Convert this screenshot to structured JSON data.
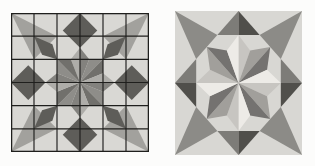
{
  "page": {
    "background": "#fcfcfb"
  },
  "figures": [
    {
      "name": "quilt-block-grid-design",
      "x": 11,
      "y": 13,
      "width": 138,
      "height": 139,
      "units": 12,
      "background": "#d9d8d4",
      "grid": {
        "divisions": 6,
        "color": "#1f1f1d",
        "line_width": 0.1,
        "border_width": 0.22
      },
      "polygons": [
        {
          "points": [
            [
              0,
              0
            ],
            [
              4,
              2
            ],
            [
              2,
              4
            ]
          ],
          "fill": "#a2a19d"
        },
        {
          "points": [
            [
              12,
              0
            ],
            [
              8,
              2
            ],
            [
              10,
              4
            ]
          ],
          "fill": "#a2a19d"
        },
        {
          "points": [
            [
              0,
              12
            ],
            [
              2,
              8
            ],
            [
              4,
              10
            ]
          ],
          "fill": "#a2a19d"
        },
        {
          "points": [
            [
              12,
              12
            ],
            [
              10,
              8
            ],
            [
              8,
              10
            ]
          ],
          "fill": "#a2a19d"
        },
        {
          "points": [
            [
              6,
              0
            ],
            [
              7.5,
              1.5
            ],
            [
              6,
              3
            ],
            [
              4.5,
              1.5
            ]
          ],
          "fill": "#5e5d59"
        },
        {
          "points": [
            [
              12,
              6
            ],
            [
              10.5,
              7.5
            ],
            [
              9,
              6
            ],
            [
              10.5,
              4.5
            ]
          ],
          "fill": "#5e5d59"
        },
        {
          "points": [
            [
              6,
              12
            ],
            [
              4.5,
              10.5
            ],
            [
              6,
              9
            ],
            [
              7.5,
              10.5
            ]
          ],
          "fill": "#5e5d59"
        },
        {
          "points": [
            [
              0,
              6
            ],
            [
              1.5,
              4.5
            ],
            [
              3,
              6
            ],
            [
              1.5,
              7.5
            ]
          ],
          "fill": "#5e5d59"
        },
        {
          "points": [
            [
              2,
              2
            ],
            [
              3.6,
              2.7
            ],
            [
              4,
              4
            ],
            [
              2.7,
              3.6
            ]
          ],
          "fill": "#5e5d59"
        },
        {
          "points": [
            [
              10,
              2
            ],
            [
              9.3,
              3.6
            ],
            [
              8,
              4
            ],
            [
              8.4,
              2.7
            ]
          ],
          "fill": "#5e5d59"
        },
        {
          "points": [
            [
              2,
              10
            ],
            [
              2.7,
              8.4
            ],
            [
              4,
              8
            ],
            [
              3.6,
              9.3
            ]
          ],
          "fill": "#5e5d59"
        },
        {
          "points": [
            [
              10,
              10
            ],
            [
              8.4,
              9.3
            ],
            [
              8,
              8
            ],
            [
              9.3,
              8.4
            ]
          ],
          "fill": "#5e5d59"
        },
        {
          "points": [
            [
              6,
              6
            ],
            [
              5.2,
              4
            ],
            [
              6,
              3
            ]
          ],
          "fill": "#aeada9"
        },
        {
          "points": [
            [
              6,
              6
            ],
            [
              6,
              3
            ],
            [
              6.8,
              4
            ]
          ],
          "fill": "#83827e"
        },
        {
          "points": [
            [
              6,
              6
            ],
            [
              6.8,
              4
            ],
            [
              8,
              4
            ]
          ],
          "fill": "#8e8d89"
        },
        {
          "points": [
            [
              6,
              6
            ],
            [
              8,
              4
            ],
            [
              8,
              5.2
            ]
          ],
          "fill": "#71706c"
        },
        {
          "points": [
            [
              6,
              6
            ],
            [
              8,
              5.2
            ],
            [
              9,
              6
            ]
          ],
          "fill": "#aeada9"
        },
        {
          "points": [
            [
              6,
              6
            ],
            [
              9,
              6
            ],
            [
              8,
              6.8
            ]
          ],
          "fill": "#83827e"
        },
        {
          "points": [
            [
              6,
              6
            ],
            [
              8,
              6.8
            ],
            [
              8,
              8
            ]
          ],
          "fill": "#8e8d89"
        },
        {
          "points": [
            [
              6,
              6
            ],
            [
              8,
              8
            ],
            [
              6.8,
              8
            ]
          ],
          "fill": "#71706c"
        },
        {
          "points": [
            [
              6,
              6
            ],
            [
              6.8,
              8
            ],
            [
              6,
              9
            ]
          ],
          "fill": "#aeada9"
        },
        {
          "points": [
            [
              6,
              6
            ],
            [
              6,
              9
            ],
            [
              5.2,
              8
            ]
          ],
          "fill": "#83827e"
        },
        {
          "points": [
            [
              6,
              6
            ],
            [
              5.2,
              8
            ],
            [
              4,
              8
            ]
          ],
          "fill": "#8e8d89"
        },
        {
          "points": [
            [
              6,
              6
            ],
            [
              4,
              8
            ],
            [
              4,
              6.8
            ]
          ],
          "fill": "#71706c"
        },
        {
          "points": [
            [
              6,
              6
            ],
            [
              4,
              6.8
            ],
            [
              3,
              6
            ]
          ],
          "fill": "#aeada9"
        },
        {
          "points": [
            [
              6,
              6
            ],
            [
              3,
              6
            ],
            [
              4,
              5.2
            ]
          ],
          "fill": "#83827e"
        },
        {
          "points": [
            [
              6,
              6
            ],
            [
              4,
              5.2
            ],
            [
              4,
              4
            ]
          ],
          "fill": "#8e8d89"
        },
        {
          "points": [
            [
              6,
              6
            ],
            [
              4,
              4
            ],
            [
              5.2,
              4
            ]
          ],
          "fill": "#71706c"
        }
      ]
    },
    {
      "name": "quilt-block-rendered",
      "x": 175,
      "y": 11,
      "width": 127,
      "height": 144,
      "units": 12,
      "background": "#d8d7d3",
      "grid": null,
      "polygons": [
        {
          "points": [
            [
              0,
              0
            ],
            [
              4,
              2
            ],
            [
              2,
              4
            ]
          ],
          "fill": "#8c8b87"
        },
        {
          "points": [
            [
              12,
              0
            ],
            [
              8,
              2
            ],
            [
              10,
              4
            ]
          ],
          "fill": "#8c8b87"
        },
        {
          "points": [
            [
              0,
              12
            ],
            [
              2,
              8
            ],
            [
              4,
              10
            ]
          ],
          "fill": "#8c8b87"
        },
        {
          "points": [
            [
              12,
              12
            ],
            [
              10,
              8
            ],
            [
              8,
              10
            ]
          ],
          "fill": "#8c8b87"
        },
        {
          "points": [
            [
              4,
              2
            ],
            [
              6,
              0
            ],
            [
              6,
              2
            ]
          ],
          "fill": "#7d7c78"
        },
        {
          "points": [
            [
              6,
              0
            ],
            [
              8,
              2
            ],
            [
              6,
              2
            ]
          ],
          "fill": "#504f4b"
        },
        {
          "points": [
            [
              10,
              4
            ],
            [
              12,
              6
            ],
            [
              10,
              6
            ]
          ],
          "fill": "#7d7c78"
        },
        {
          "points": [
            [
              12,
              6
            ],
            [
              10,
              8
            ],
            [
              10,
              6
            ]
          ],
          "fill": "#504f4b"
        },
        {
          "points": [
            [
              4,
              10
            ],
            [
              6,
              12
            ],
            [
              6,
              10
            ]
          ],
          "fill": "#7d7c78"
        },
        {
          "points": [
            [
              6,
              12
            ],
            [
              8,
              10
            ],
            [
              6,
              10
            ]
          ],
          "fill": "#504f4b"
        },
        {
          "points": [
            [
              2,
              4
            ],
            [
              0,
              6
            ],
            [
              2,
              6
            ]
          ],
          "fill": "#7d7c78"
        },
        {
          "points": [
            [
              0,
              6
            ],
            [
              2,
              8
            ],
            [
              2,
              6
            ]
          ],
          "fill": "#504f4b"
        },
        {
          "points": [
            [
              6,
              6
            ],
            [
              6,
              2
            ],
            [
              7.1,
              3.3
            ]
          ],
          "fill": "#c7c5c1"
        },
        {
          "points": [
            [
              6,
              6
            ],
            [
              7.1,
              3.3
            ],
            [
              9,
              3
            ]
          ],
          "fill": "#a19f9b"
        },
        {
          "points": [
            [
              6,
              6
            ],
            [
              9,
              3
            ],
            [
              8.7,
              4.9
            ]
          ],
          "fill": "#747270"
        },
        {
          "points": [
            [
              6,
              6
            ],
            [
              8.7,
              4.9
            ],
            [
              10,
              6
            ]
          ],
          "fill": "#edebe7"
        },
        {
          "points": [
            [
              6,
              6
            ],
            [
              10,
              6
            ],
            [
              8.7,
              7.1
            ]
          ],
          "fill": "#c7c5c1"
        },
        {
          "points": [
            [
              6,
              6
            ],
            [
              8.7,
              7.1
            ],
            [
              9,
              9
            ]
          ],
          "fill": "#a19f9b"
        },
        {
          "points": [
            [
              6,
              6
            ],
            [
              9,
              9
            ],
            [
              7.1,
              8.7
            ]
          ],
          "fill": "#747270"
        },
        {
          "points": [
            [
              6,
              6
            ],
            [
              7.1,
              8.7
            ],
            [
              6,
              10
            ]
          ],
          "fill": "#edebe7"
        },
        {
          "points": [
            [
              6,
              6
            ],
            [
              6,
              10
            ],
            [
              4.9,
              8.7
            ]
          ],
          "fill": "#c7c5c1"
        },
        {
          "points": [
            [
              6,
              6
            ],
            [
              4.9,
              8.7
            ],
            [
              3,
              9
            ]
          ],
          "fill": "#a19f9b"
        },
        {
          "points": [
            [
              6,
              6
            ],
            [
              3,
              9
            ],
            [
              3.3,
              7.1
            ]
          ],
          "fill": "#747270"
        },
        {
          "points": [
            [
              6,
              6
            ],
            [
              3.3,
              7.1
            ],
            [
              2,
              6
            ]
          ],
          "fill": "#edebe7"
        },
        {
          "points": [
            [
              6,
              6
            ],
            [
              2,
              6
            ],
            [
              3.3,
              4.9
            ]
          ],
          "fill": "#c7c5c1"
        },
        {
          "points": [
            [
              6,
              6
            ],
            [
              3.3,
              4.9
            ],
            [
              3,
              3
            ]
          ],
          "fill": "#a19f9b"
        },
        {
          "points": [
            [
              6,
              6
            ],
            [
              3,
              3
            ],
            [
              4.9,
              3.3
            ]
          ],
          "fill": "#747270"
        },
        {
          "points": [
            [
              6,
              6
            ],
            [
              4.9,
              3.3
            ],
            [
              6,
              2
            ]
          ],
          "fill": "#edebe7"
        }
      ]
    }
  ]
}
